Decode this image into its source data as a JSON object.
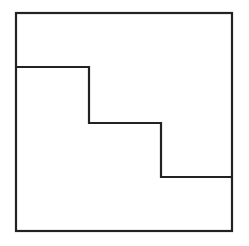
{
  "diagram": {
    "stroke_color": "#222222",
    "background": "#ffffff",
    "square": {
      "x": 16,
      "y": 13,
      "width": 216,
      "height": 218
    },
    "staircase_points": [
      [
        16,
        67
      ],
      [
        89,
        67
      ],
      [
        89,
        123
      ],
      [
        161,
        123
      ],
      [
        161,
        177
      ],
      [
        232,
        177
      ]
    ]
  }
}
